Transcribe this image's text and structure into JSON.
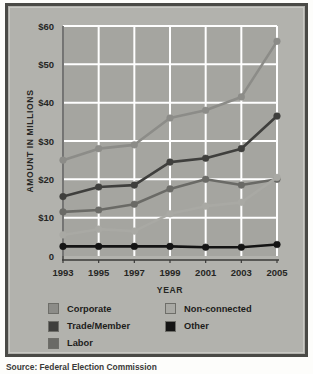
{
  "source_note": "Source: Federal Election Commission",
  "legend": {
    "columns": [
      [
        {
          "label": "Corporate",
          "color": "#8c8c88",
          "key": "corporate"
        },
        {
          "label": "Trade/Member",
          "color": "#3f3f3d",
          "key": "trade_member"
        },
        {
          "label": "Labor",
          "color": "#6a6a66",
          "key": "labor"
        }
      ],
      [
        {
          "label": "Non-connected",
          "color": "#a9a9a4",
          "key": "non_connected"
        },
        {
          "label": "Other",
          "color": "#141414",
          "key": "other"
        }
      ]
    ]
  },
  "chart_data": {
    "type": "line",
    "title": "",
    "xlabel": "YEAR",
    "ylabel": "AMOUNT IN MILLIONS",
    "x": [
      1993,
      1995,
      1997,
      1999,
      2001,
      2003,
      2005
    ],
    "xtick_labels": [
      "1993",
      "1995",
      "1997",
      "1999",
      "2001",
      "2003",
      "2005"
    ],
    "ylim": [
      0,
      60
    ],
    "yticks": [
      0,
      10,
      20,
      30,
      40,
      50,
      60
    ],
    "ytick_labels": [
      "0",
      "$10",
      "$20",
      "$30",
      "$40",
      "$50",
      "$60"
    ],
    "grid": true,
    "grid_color": "#ffffff",
    "plot_background": "#a5a5a0",
    "legend_position": "bottom",
    "units": "millions of dollars",
    "series": [
      {
        "name": "Corporate",
        "color": "#8c8c88",
        "values": [
          25.0,
          28.0,
          29.0,
          36.0,
          38.0,
          41.5,
          56.0
        ]
      },
      {
        "name": "Trade/Member",
        "color": "#3f3f3d",
        "values": [
          15.5,
          18.0,
          18.5,
          24.5,
          25.5,
          28.0,
          36.5
        ]
      },
      {
        "name": "Labor",
        "color": "#6a6a66",
        "values": [
          11.5,
          12.0,
          13.5,
          17.5,
          20.0,
          18.5,
          20.0
        ]
      },
      {
        "name": "Non-connected",
        "color": "#a9a9a4",
        "values": [
          5.5,
          7.0,
          6.5,
          11.0,
          13.0,
          14.0,
          20.5
        ]
      },
      {
        "name": "Other",
        "color": "#141414",
        "values": [
          2.5,
          2.5,
          2.5,
          2.5,
          2.3,
          2.3,
          3.0
        ]
      }
    ]
  }
}
